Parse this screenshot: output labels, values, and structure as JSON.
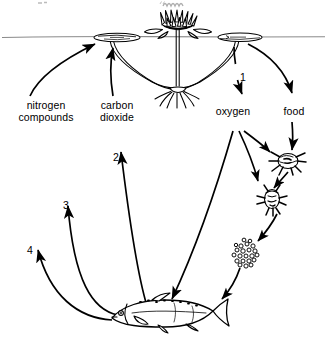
{
  "diagram": {
    "type": "biological cycle diagram",
    "background_color": "#ffffff",
    "ink_color": "#000000",
    "waterline_color": "#7a7a7a",
    "labels": {
      "nitrogen_compounds_line1": "nitrogen",
      "nitrogen_compounds_line2": "compounds",
      "carbon_dioxide_line1": "carbon",
      "carbon_dioxide_line2": "dioxide",
      "oxygen": "oxygen",
      "food": "food"
    },
    "numbers": {
      "one": "1",
      "two": "2",
      "three": "3",
      "four": "4"
    },
    "organisms": {
      "plant": "water-lily",
      "consumer_1": "insect-larva",
      "consumer_2": "crustacean",
      "decomposer": "bacteria-detritus-cluster",
      "fish": "fish"
    }
  }
}
